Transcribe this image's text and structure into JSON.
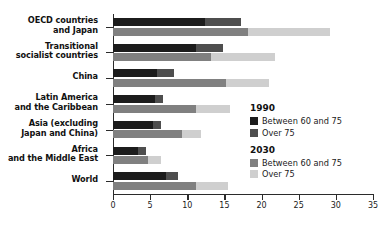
{
  "chart_data": {
    "type": "bar",
    "orientation": "horizontal",
    "title": "",
    "xlabel": "",
    "ylabel": "",
    "xlim": [
      0,
      35
    ],
    "xticks": [
      0,
      5,
      10,
      15,
      20,
      25,
      30,
      35
    ],
    "grid": false,
    "legend_position": "right",
    "categories": [
      "OECD countries\nand Japan",
      "Transitional\nsocialist countries",
      "China",
      "Latin America\nand the Caribbean",
      "Asia (excluding\nJapan and China)",
      "Africa\nand the Middle East",
      "World"
    ],
    "series": [
      {
        "name": "1990 Between 60 and 75",
        "color": "#1c1c1c",
        "values": [
          12.4,
          11.2,
          5.9,
          5.7,
          5.4,
          3.4,
          7.1
        ]
      },
      {
        "name": "1990 Over 75",
        "color": "#4e4e4e",
        "values": [
          4.8,
          3.6,
          2.3,
          1.0,
          1.1,
          1.0,
          1.7
        ]
      },
      {
        "name": "2030 Between 60 and 75",
        "color": "#808080",
        "values": [
          18.2,
          13.2,
          15.2,
          11.2,
          9.3,
          4.7,
          11.2
        ]
      },
      {
        "name": "2030 Over 75",
        "color": "#cfcfcf",
        "values": [
          11.0,
          8.6,
          5.8,
          4.5,
          2.5,
          1.8,
          4.3
        ]
      }
    ]
  },
  "legend": {
    "groups": [
      {
        "title": "1990",
        "entries": [
          {
            "label": "Between 60 and 75",
            "color": "#1c1c1c"
          },
          {
            "label": "Over 75",
            "color": "#4e4e4e"
          }
        ]
      },
      {
        "title": "2030",
        "entries": [
          {
            "label": "Between 60 and 75",
            "color": "#808080"
          },
          {
            "label": "Over 75",
            "color": "#cfcfcf"
          }
        ]
      }
    ]
  }
}
